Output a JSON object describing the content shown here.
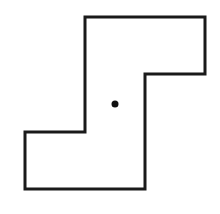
{
  "diagram": {
    "shape": "s-shaped-polygon",
    "outline_color": "#1a1a1a",
    "fill_color": "#ffffff",
    "stroke_width": 3,
    "points": [
      [
        85,
        17
      ],
      [
        205,
        17
      ],
      [
        205,
        74
      ],
      [
        145,
        74
      ],
      [
        145,
        189
      ],
      [
        25,
        189
      ],
      [
        25,
        132
      ],
      [
        85,
        132
      ]
    ],
    "center_dot": {
      "x": 115,
      "y": 104,
      "r": 3.5,
      "color": "#111111"
    }
  }
}
